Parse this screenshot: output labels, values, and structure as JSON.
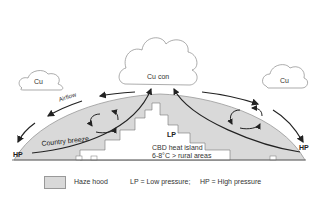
{
  "diagram": {
    "type": "urban heat island circulation",
    "clouds": {
      "left": "Cu",
      "center": "Cu con",
      "right": "Cu"
    },
    "labels": {
      "airflow": "Airflow",
      "country_breeze": "Country breeze",
      "lp": "LP",
      "cbd_line1": "CBD heat island",
      "cbd_line2": "6-8°C > rural areas",
      "hp_left": "HP",
      "hp_right": "HP"
    },
    "legend": {
      "haze_hood": "Haze hood",
      "lp_def": "LP  = Low pressure;",
      "hp_def": "HP  = High pressure"
    },
    "colors": {
      "haze": "#d9d9d9",
      "line": "#222222",
      "cloud_stroke": "#888888"
    }
  }
}
